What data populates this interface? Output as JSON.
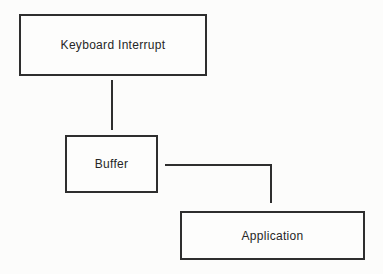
{
  "diagram": {
    "title": "",
    "nodes": [
      {
        "id": "keyboard-interrupt",
        "label": "Keyboard Interrupt"
      },
      {
        "id": "buffer",
        "label": "Buffer"
      },
      {
        "id": "application",
        "label": "Application"
      }
    ],
    "connections": [
      {
        "from": "keyboard-interrupt",
        "to": "buffer",
        "shape": "vertical-line"
      },
      {
        "from": "buffer",
        "to": "application",
        "shape": "elbow-right-then-down"
      }
    ],
    "colors": {
      "line": "#2e2e2e",
      "box_border": "#2e2e2e",
      "background": "#fcfcfb",
      "text": "#262626"
    }
  }
}
